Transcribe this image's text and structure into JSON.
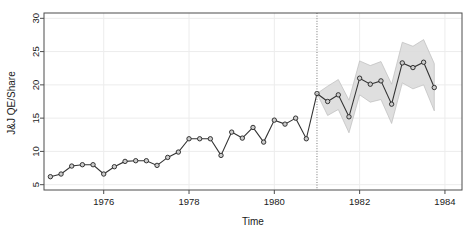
{
  "chart_data": {
    "type": "line",
    "title": "",
    "xlabel": "Time",
    "ylabel": "J&J QE/Share",
    "xlim": [
      1974.6,
      1984.4
    ],
    "ylim": [
      4.2,
      30.8
    ],
    "xticks": [
      1976,
      1978,
      1980,
      1982,
      1984
    ],
    "yticks": [
      5,
      10,
      15,
      20,
      25,
      30
    ],
    "grid": true,
    "legend": "none",
    "line_color": "#333333",
    "point_fill": "#cccccc",
    "point_stroke": "#222222",
    "band_fill": "#d9d9d9",
    "band_stroke": "#bbbbbb",
    "divider_x": 1981.0,
    "divider_style": "dotted",
    "series": [
      {
        "name": "J&J quarterly earnings per share (observed)",
        "kind": "observed",
        "x": [
          1974.75,
          1975.0,
          1975.25,
          1975.5,
          1975.75,
          1976.0,
          1976.25,
          1976.5,
          1976.75,
          1977.0,
          1977.25,
          1977.5,
          1977.75,
          1978.0,
          1978.25,
          1978.5,
          1978.75,
          1979.0,
          1979.25,
          1979.5,
          1979.75,
          1980.0,
          1980.25,
          1980.5,
          1980.75,
          1981.0
        ],
        "values": [
          6.2,
          6.6,
          7.8,
          8.0,
          8.0,
          6.6,
          7.7,
          8.5,
          8.6,
          8.6,
          7.9,
          9.1,
          9.9,
          11.9,
          11.9,
          11.9,
          9.4,
          12.9,
          12.0,
          13.6,
          11.4,
          14.7,
          14.1,
          15.0,
          11.9,
          18.7
        ]
      },
      {
        "name": "Forecast (mean)",
        "kind": "forecast",
        "x": [
          1981.0,
          1981.25,
          1981.5,
          1981.75,
          1982.0,
          1982.25,
          1982.5,
          1982.75,
          1983.0,
          1983.25,
          1983.5,
          1983.75
        ],
        "values": [
          18.7,
          17.5,
          18.5,
          15.2,
          21.0,
          20.1,
          20.6,
          17.1,
          23.3,
          22.6,
          23.4,
          19.6
        ],
        "lower": [
          18.7,
          15.4,
          16.3,
          12.8,
          18.5,
          17.4,
          17.8,
          14.2,
          20.3,
          19.4,
          20.0,
          16.1
        ],
        "upper": [
          18.7,
          19.8,
          20.8,
          17.7,
          23.6,
          22.9,
          23.5,
          20.1,
          26.4,
          25.8,
          26.8,
          23.2
        ]
      }
    ]
  },
  "axes": {
    "y_label": "J&J QE/Share",
    "x_label": "Time",
    "y_tick_labels": [
      "5",
      "10",
      "15",
      "20",
      "25",
      "30"
    ],
    "x_tick_labels": [
      "1976",
      "1978",
      "1980",
      "1982",
      "1984"
    ]
  }
}
